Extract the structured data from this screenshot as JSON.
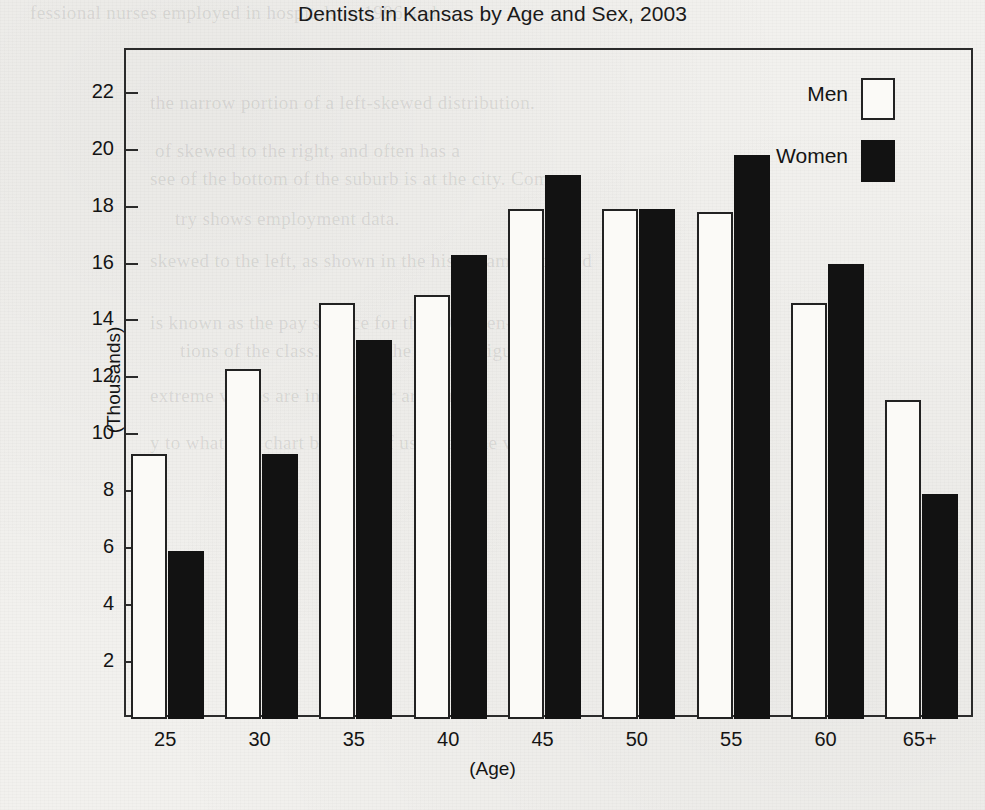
{
  "chart_data": {
    "type": "bar",
    "title": "Dentists in Kansas by Age and Sex, 2003",
    "xlabel": "(Age)",
    "ylabel": "(Thousands)",
    "categories": [
      "25",
      "30",
      "35",
      "40",
      "45",
      "50",
      "55",
      "60",
      "65+"
    ],
    "series": [
      {
        "name": "Men",
        "values": [
          9.3,
          12.3,
          14.6,
          14.9,
          17.9,
          17.9,
          17.8,
          14.6,
          11.2
        ]
      },
      {
        "name": "Women",
        "values": [
          5.9,
          9.3,
          13.3,
          16.3,
          19.1,
          17.9,
          19.8,
          16.0,
          7.9
        ]
      }
    ],
    "ylim": [
      0,
      23.5
    ],
    "yticks": [
      2,
      4,
      6,
      8,
      10,
      12,
      14,
      16,
      18,
      20,
      22
    ],
    "ytick_labels": [
      "2",
      "4",
      "6",
      "8",
      "10",
      "12",
      "14",
      "16",
      "18",
      "20",
      "22"
    ],
    "grid": false,
    "legend_position": "top-right",
    "legend": [
      {
        "label": "Men",
        "swatch": "white-outlined"
      },
      {
        "label": "Women",
        "swatch": "black-filled"
      }
    ],
    "colors": {
      "men": "#fbfaf7",
      "women": "#121212",
      "axis": "#2b2b2b",
      "text": "#141414"
    }
  },
  "background_bleed_text": [
    "fessional nurses employed in hospitals in 1996 and",
    "the narrow portion of a left-skewed distribution.",
    "of skewed to the right, and often has a",
    "see of the bottom of the suburb is at the city. Com-",
    "try shows employment data.",
    "skewed to the left, as shown in the histogram displayed",
    "is known as the pay service for the 2003 ben-",
    "tions of the class. Record the data in Figure 2",
    "extreme values are in the other are sure",
    "y to what you chart because of using all the val"
  ]
}
